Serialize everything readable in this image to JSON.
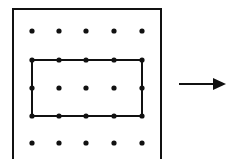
{
  "diagram": {
    "type": "geoboard-transformation",
    "frame": {
      "left": 13,
      "top": 9,
      "right": 161,
      "bottom": 159,
      "open_bottom": true,
      "stroke": "#111111",
      "stroke_width": 2
    },
    "grid": {
      "columns_x": [
        32,
        59,
        86,
        114,
        142
      ],
      "rows_y": [
        31,
        60,
        88,
        116,
        143
      ],
      "dot_radius": 2.6,
      "dot_color": "#111111"
    },
    "rectangle": {
      "from": {
        "col": 0,
        "row": 1
      },
      "to": {
        "col": 4,
        "row": 3
      },
      "stroke": "#111111",
      "stroke_width": 2,
      "width_units": 4,
      "height_units": 2
    },
    "arrow": {
      "x1": 179,
      "y1": 84,
      "x2": 226,
      "y2": 84,
      "direction": "right",
      "color": "#111111"
    }
  }
}
